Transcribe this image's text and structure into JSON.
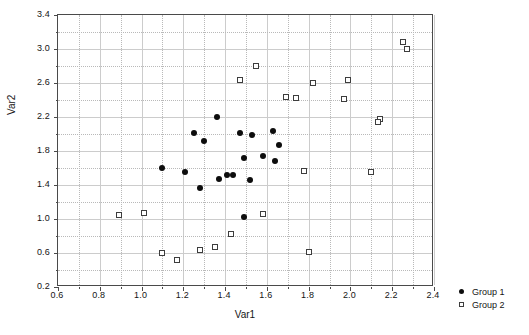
{
  "chart_data": {
    "type": "scatter",
    "title": "",
    "xlabel": "Var1",
    "ylabel": "Var2",
    "xlim": [
      0.6,
      2.4
    ],
    "ylim": [
      0.2,
      3.4
    ],
    "xticks": [
      "0.6",
      "0.8",
      "1.0",
      "1.2",
      "1.4",
      "1.6",
      "1.8",
      "2.0",
      "2.2",
      "2.4"
    ],
    "yticks": [
      "0.2",
      "0.6",
      "1.0",
      "1.4",
      "1.8",
      "2.2",
      "2.6",
      "3.0",
      "3.4"
    ],
    "xtick_values": [
      0.6,
      0.8,
      1.0,
      1.2,
      1.4,
      1.6,
      1.8,
      2.0,
      2.2,
      2.4
    ],
    "ytick_values": [
      0.2,
      0.6,
      1.0,
      1.4,
      1.8,
      2.2,
      2.6,
      3.0,
      3.4
    ],
    "grid": true,
    "grid_style": "dotted",
    "legend_position": "right-bottom-outside",
    "series": [
      {
        "name": "Group 1",
        "marker": "filled-circle",
        "color": "#0d0d0d",
        "points": [
          [
            1.36,
            2.2
          ],
          [
            1.25,
            2.01
          ],
          [
            1.47,
            2.01
          ],
          [
            1.53,
            1.99
          ],
          [
            1.63,
            2.04
          ],
          [
            1.3,
            1.92
          ],
          [
            1.1,
            1.6
          ],
          [
            1.66,
            1.87
          ],
          [
            1.58,
            1.74
          ],
          [
            1.64,
            1.68
          ],
          [
            1.49,
            1.72
          ],
          [
            1.21,
            1.55
          ],
          [
            1.41,
            1.52
          ],
          [
            1.44,
            1.52
          ],
          [
            1.37,
            1.47
          ],
          [
            1.52,
            1.46
          ],
          [
            1.28,
            1.37
          ],
          [
            1.49,
            1.02
          ]
        ]
      },
      {
        "name": "Group 2",
        "marker": "open-square",
        "color": "#3d3d3d",
        "points": [
          [
            2.25,
            3.08
          ],
          [
            2.27,
            3.0
          ],
          [
            1.55,
            2.8
          ],
          [
            1.47,
            2.64
          ],
          [
            1.82,
            2.6
          ],
          [
            1.99,
            2.64
          ],
          [
            1.69,
            2.44
          ],
          [
            1.74,
            2.42
          ],
          [
            1.97,
            2.41
          ],
          [
            2.14,
            2.18
          ],
          [
            2.13,
            2.14
          ],
          [
            1.78,
            1.56
          ],
          [
            2.1,
            1.55
          ],
          [
            1.35,
            0.67
          ],
          [
            1.28,
            0.63
          ],
          [
            1.01,
            1.07
          ],
          [
            0.89,
            1.05
          ],
          [
            1.58,
            1.06
          ],
          [
            1.43,
            0.82
          ],
          [
            1.8,
            0.61
          ],
          [
            1.1,
            0.6
          ],
          [
            1.17,
            0.52
          ]
        ]
      }
    ]
  },
  "legend": {
    "entries": [
      {
        "label": "Group 1"
      },
      {
        "label": "Group 2"
      }
    ]
  }
}
